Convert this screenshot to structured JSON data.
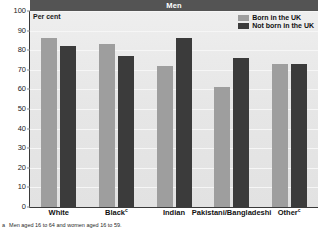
{
  "chart_data": {
    "type": "bar",
    "title": "Men",
    "subtitle": "",
    "xlabel": "",
    "ylabel": "Per cent",
    "ylim": [
      0,
      100
    ],
    "ytick_step": 10,
    "yticks": [
      0,
      10,
      20,
      30,
      40,
      50,
      60,
      70,
      80,
      90,
      100
    ],
    "grid": true,
    "legend_position": "top-right",
    "categories": [
      "White",
      "Black",
      "Indian",
      "Pakistani/Bangladeshi",
      "Other"
    ],
    "category_superscripts": [
      "",
      "c",
      "",
      "",
      "c"
    ],
    "series": [
      {
        "name": "Born in the UK",
        "color": "#9e9e9e",
        "values": [
          86,
          83,
          72,
          61,
          73
        ]
      },
      {
        "name": "Not born in the UK",
        "color": "#3b3b3b",
        "values": [
          82,
          77,
          86,
          76,
          73
        ]
      }
    ],
    "annotations": []
  },
  "header": {
    "title": "Men"
  },
  "axis": {
    "y_title": "Per cent",
    "tick_labels": [
      "100",
      "90",
      "80",
      "70",
      "60",
      "50",
      "40",
      "30",
      "20",
      "10",
      "0"
    ]
  },
  "legend": {
    "items": [
      {
        "label": "Born in the UK",
        "swatch": "uk"
      },
      {
        "label": "Not born in the UK",
        "swatch": "nonuk"
      }
    ]
  },
  "footnote": {
    "marker": "a",
    "text": "Men aged 16 to 64 and women aged 16 to 59."
  },
  "colors": {
    "title_band": "#545454",
    "plot_background": "#e8e8e8",
    "series_uk": "#9e9e9e",
    "series_nonuk": "#3b3b3b",
    "axis": "#3a3a3a"
  }
}
